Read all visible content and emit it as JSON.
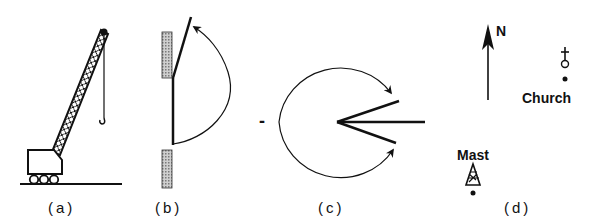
{
  "figure": {
    "panels": [
      {
        "id": "a",
        "label": "(a)",
        "subject": "crane"
      },
      {
        "id": "b",
        "label": "(b)",
        "subject": "hinged door opening in wall"
      },
      {
        "id": "c",
        "label": "(c)",
        "subject": "rotation arcs about a vertex"
      },
      {
        "id": "d",
        "label": "(d)",
        "subject": "map bearings"
      }
    ],
    "panel_c": {
      "minus_sign": "-"
    },
    "panel_d": {
      "north_label": "N",
      "church_label": "Church",
      "mast_label": "Mast"
    }
  },
  "colors": {
    "ink": "#111111",
    "hatch": "#9a9a9a",
    "background": "#ffffff"
  }
}
